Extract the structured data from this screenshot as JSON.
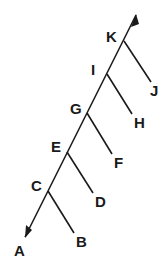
{
  "diagram": {
    "type": "cladogram",
    "line_color": "#1a1a1a",
    "main_axis": {
      "start": [
        25,
        237
      ],
      "end": [
        136,
        15
      ],
      "arrows": [
        "both"
      ]
    },
    "nodes": [
      {
        "id": "C",
        "label": "C",
        "junction": [
          48,
          191
        ],
        "label_pos": [
          30,
          191
        ],
        "branch": {
          "label": "B",
          "end": [
            74,
            233
          ],
          "label_pos": [
            76,
            247
          ]
        }
      },
      {
        "id": "E",
        "label": "E",
        "junction": [
          67,
          152
        ],
        "label_pos": [
          49,
          152
        ],
        "branch": {
          "label": "D",
          "end": [
            93,
            193
          ],
          "label_pos": [
            95,
            207
          ]
        }
      },
      {
        "id": "G",
        "label": "G",
        "junction": [
          87,
          113
        ],
        "label_pos": [
          69,
          114
        ],
        "branch": {
          "label": "F",
          "end": [
            112,
            154
          ],
          "label_pos": [
            114,
            168
          ]
        }
      },
      {
        "id": "I",
        "label": "I",
        "junction": [
          107,
          74
        ],
        "label_pos": [
          90,
          75
        ],
        "branch": {
          "label": "H",
          "end": [
            132,
            114
          ],
          "label_pos": [
            134,
            128
          ]
        }
      },
      {
        "id": "K",
        "label": "K",
        "junction": [
          124,
          41
        ],
        "label_pos": [
          106,
          42
        ],
        "branch": {
          "label": "J",
          "end": [
            151,
            82
          ],
          "label_pos": [
            150,
            96
          ]
        }
      }
    ],
    "terminal": {
      "label": "A",
      "label_pos": [
        14,
        256
      ]
    }
  }
}
